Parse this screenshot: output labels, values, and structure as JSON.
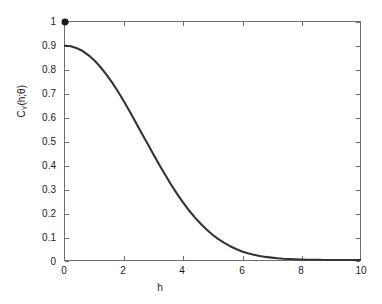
{
  "chart_data": {
    "type": "line",
    "title": "",
    "xlabel": "h",
    "ylabel": "C_Y(h;θ)",
    "ylabel_parts": {
      "main": "C",
      "subscript": "Y",
      "argument": "(h;θ)"
    },
    "xlim": [
      0,
      10
    ],
    "ylim": [
      0,
      1
    ],
    "grid": false,
    "legend": null,
    "line_color": "#333333",
    "marker_color": "#1a1a1a",
    "axis_color": "#6f6f6f",
    "background_color": "#ffffff",
    "xticks": [
      0,
      2,
      4,
      6,
      8,
      10
    ],
    "xtick_labels": [
      "0",
      "2",
      "4",
      "6",
      "8",
      "10"
    ],
    "yticks": [
      0,
      0.1,
      0.2,
      0.3,
      0.4,
      0.5,
      0.6,
      0.7,
      0.8,
      0.9,
      1
    ],
    "ytick_labels": [
      "0",
      "0.1",
      "0.2",
      "0.3",
      "0.4",
      "0.5",
      "0.6",
      "0.7",
      "0.8",
      "0.9",
      "1"
    ],
    "series": [
      {
        "name": "covariance",
        "kind": "line",
        "x": [
          0,
          0.2,
          0.4,
          0.6,
          0.8,
          1.0,
          1.2,
          1.4,
          1.6,
          1.8,
          2.0,
          2.2,
          2.4,
          2.6,
          2.8,
          3.0,
          3.2,
          3.4,
          3.6,
          3.8,
          4.0,
          4.2,
          4.4,
          4.6,
          4.8,
          5.0,
          5.2,
          5.4,
          5.6,
          5.8,
          6.0,
          6.2,
          6.4,
          6.6,
          6.8,
          7.0,
          7.2,
          7.4,
          7.6,
          7.8,
          8.0,
          8.2,
          8.4,
          8.6,
          8.8,
          9.0,
          9.2,
          9.4,
          9.6,
          9.8,
          10.0
        ],
        "y": [
          0.9,
          0.898,
          0.89,
          0.878,
          0.86,
          0.838,
          0.811,
          0.78,
          0.745,
          0.707,
          0.666,
          0.623,
          0.578,
          0.533,
          0.488,
          0.443,
          0.399,
          0.357,
          0.316,
          0.278,
          0.242,
          0.209,
          0.179,
          0.152,
          0.128,
          0.106,
          0.088,
          0.072,
          0.058,
          0.046,
          0.036,
          0.028,
          0.022,
          0.017,
          0.013,
          0.01,
          0.007,
          0.005,
          0.004,
          0.003,
          0.002,
          0.001,
          0.001,
          0.001,
          0.0,
          0.0,
          0.0,
          0.0,
          0.0,
          0.0,
          0.0
        ]
      },
      {
        "name": "nugget-point",
        "kind": "marker",
        "x": [
          0
        ],
        "y": [
          1.0
        ],
        "marker": "filled-circle",
        "marker_size": 7
      }
    ],
    "annotations": [
      {
        "text": "filled marker at h=0 indicates total variance (sill + nugget) equal to 1",
        "visible": false
      }
    ]
  },
  "axes": {
    "x_title": "h",
    "y_title_main": "C",
    "y_title_sub": "Y",
    "y_title_arg": "(h;θ)"
  }
}
